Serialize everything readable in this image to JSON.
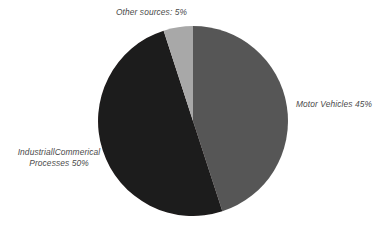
{
  "chart_data": {
    "type": "pie",
    "title": "",
    "subtitle": "",
    "xlabel": "",
    "ylabel": "",
    "legend_position": "none",
    "grid": false,
    "start_angle_deg": 0,
    "direction": "clockwise",
    "units": "%",
    "categories": [
      "Motor Vehicles",
      "Industrial/Commerical Processes",
      "Other sources"
    ],
    "values": [
      45,
      50,
      5
    ],
    "colors": [
      "#565656",
      "#1e1a1a",
      "#a8a8a8"
    ],
    "slices": [
      {
        "name": "Motor Vehicles",
        "value": 45,
        "label": "Motor Vehicles 45%",
        "color": "#565656",
        "start_deg": 0,
        "end_deg": 162
      },
      {
        "name": "Industrial/Commerical Processes",
        "value": 50,
        "label_line_1": "IndustriallCommerical",
        "label_line_2": "Processes 50%",
        "color": "#1e1a1a",
        "start_deg": 162,
        "end_deg": 342
      },
      {
        "name": "Other sources",
        "value": 5,
        "label": "Other sources: 5%",
        "color": "#a8a8a8",
        "start_deg": 342,
        "end_deg": 360
      }
    ]
  },
  "labels": {
    "other_sources": "Other sources: 5%",
    "motor_vehicles": "Motor Vehicles 45%",
    "industrial_line_1": "IndustriallCommerical",
    "industrial_line_2": "Processes 50%"
  },
  "style": {
    "background": "#ffffff",
    "label_color": "#4a4a4a"
  }
}
